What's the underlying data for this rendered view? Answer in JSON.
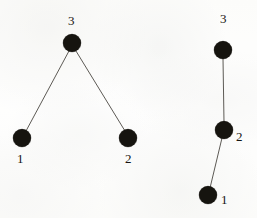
{
  "figure": {
    "background_color": "#fdfdfc",
    "node_color": "#16140f",
    "edge_color": "#5d5a55",
    "label_color": "#171512",
    "node_diameter": 18,
    "edge_width": 1
  },
  "graphs": [
    {
      "name": "left-graph",
      "nodes": [
        {
          "id": "left-node-3",
          "label": "3",
          "cx": 72,
          "cy": 43,
          "label_x": 68,
          "label_y": 14
        },
        {
          "id": "left-node-1",
          "label": "1",
          "cx": 22,
          "cy": 138,
          "label_x": 17,
          "label_y": 152
        },
        {
          "id": "left-node-2",
          "label": "2",
          "cx": 128,
          "cy": 138,
          "label_x": 125,
          "label_y": 152
        }
      ],
      "edges": [
        {
          "name": "left-edge-3-1",
          "from": "left-node-3",
          "to": "left-node-1",
          "x1": 69,
          "y1": 51,
          "x2": 26,
          "y2": 131
        },
        {
          "name": "left-edge-3-2",
          "from": "left-node-3",
          "to": "left-node-2",
          "x1": 76,
          "y1": 51,
          "x2": 125,
          "y2": 131
        }
      ]
    },
    {
      "name": "right-graph",
      "nodes": [
        {
          "id": "right-node-3",
          "label": "3",
          "cx": 223,
          "cy": 50,
          "label_x": 220,
          "label_y": 12
        },
        {
          "id": "right-node-2",
          "label": "2",
          "cx": 224,
          "cy": 130,
          "label_x": 236,
          "label_y": 130
        },
        {
          "id": "right-node-1",
          "label": "1",
          "cx": 208,
          "cy": 195,
          "label_x": 221,
          "label_y": 193
        }
      ],
      "edges": [
        {
          "name": "right-edge-3-2",
          "from": "right-node-3",
          "to": "right-node-2",
          "x1": 223,
          "y1": 58,
          "x2": 224,
          "y2": 122
        },
        {
          "name": "right-edge-2-1",
          "from": "right-node-2",
          "to": "right-node-1",
          "x1": 222,
          "y1": 138,
          "x2": 210,
          "y2": 188
        }
      ]
    }
  ]
}
